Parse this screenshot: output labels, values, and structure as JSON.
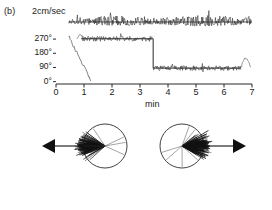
{
  "figure": {
    "panel_label": "(b)",
    "scale_bar_label": "2cm/sec"
  },
  "chart_data": {
    "type": "line",
    "title": "",
    "xlabel": "min",
    "ylabel": "",
    "xlim": [
      0,
      7
    ],
    "xticks": [
      0,
      1,
      2,
      3,
      4,
      5,
      6,
      7
    ],
    "xticklabels": [
      "0",
      "1",
      "2",
      "3",
      "4",
      "5",
      "6",
      "7"
    ],
    "yticks": [
      0,
      90,
      180,
      270
    ],
    "yticklabels": [
      "0°",
      "90°",
      "180°",
      "270°"
    ],
    "ylim": [
      315,
      -15
    ],
    "grid": false,
    "legend": false,
    "series": [
      {
        "name": "speed",
        "units": "cm/sec",
        "description": "noisy locomotion speed trace along baseline",
        "baseline_y": 22,
        "x_start": 0.45,
        "x_end": 7.0
      },
      {
        "name": "heading",
        "units": "degrees",
        "description": "body orientation versus time with ramp, plateau near 270 deg, and step transition near 3.5 min to about 85 deg",
        "segments": [
          {
            "phase": "ramp",
            "x_from": 0.45,
            "x_to": 1.25,
            "y_from": 290,
            "y_to": 10
          },
          {
            "phase": "plateau-low",
            "x_from": 0.9,
            "x_to": 3.45,
            "y": 272
          },
          {
            "phase": "step",
            "x_at": 3.47,
            "y_from": 272,
            "y_to": 86
          },
          {
            "phase": "plateau-high",
            "x_from": 3.47,
            "x_to": 6.6,
            "y": 86
          },
          {
            "phase": "tail",
            "x_from": 6.6,
            "x_to": 6.95,
            "y": 60
          }
        ]
      }
    ]
  },
  "polar_plots": [
    {
      "name": "rose-plot-left",
      "arrow_direction": "left",
      "arrow_glyph": "◀",
      "mean_vector_deg": 180,
      "spread_deg": 55,
      "n_lines": 120,
      "description": "radial line plot, vectors concentrated toward the left"
    },
    {
      "name": "rose-plot-right",
      "arrow_direction": "right",
      "arrow_glyph": "▶",
      "mean_vector_deg": 0,
      "spread_deg": 50,
      "n_lines": 120,
      "description": "radial line plot, vectors concentrated toward the right"
    }
  ],
  "colors": {
    "ink": "#111111",
    "trace": "#2a2a2a",
    "background": "#ffffff"
  }
}
